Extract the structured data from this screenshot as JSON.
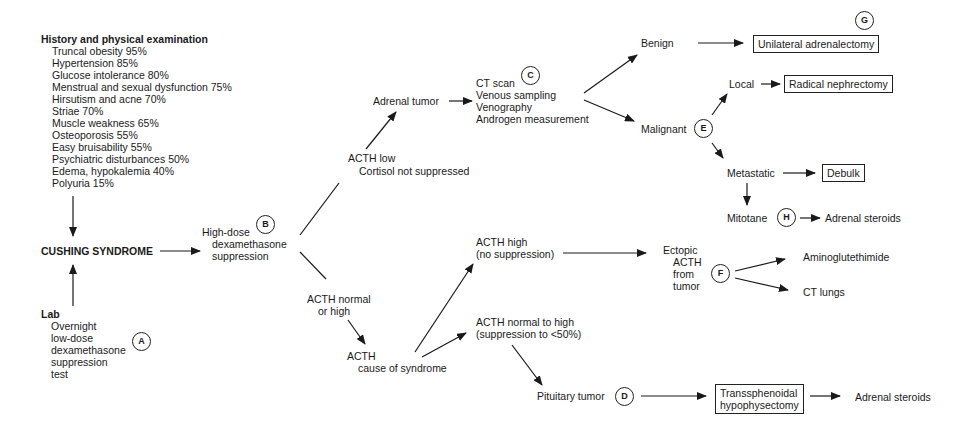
{
  "diagram": {
    "history": {
      "heading": "History and physical examination",
      "items": [
        "Truncal obesity 95%",
        "Hypertension 85%",
        "Glucose intolerance 80%",
        "Menstrual and sexual dysfunction 75%",
        "Hirsutism and acne 70%",
        "Striae 70%",
        "Muscle weakness 65%",
        "Osteoporosis 55%",
        "Easy bruisability 55%",
        "Psychiatric disturbances 50%",
        "Edema, hypokalemia 40%",
        "Polyuria 15%"
      ]
    },
    "cushing": "CUSHING SYNDROME",
    "lab": {
      "heading": "Lab",
      "lines": [
        "Overnight",
        "low-dose",
        "dexamethasone",
        "suppression",
        "test"
      ]
    },
    "high_dose": {
      "lines": [
        "High-dose",
        "dexamethasone",
        "suppression"
      ]
    },
    "acth_low": {
      "lines": [
        "ACTH low",
        "Cortisol not suppressed"
      ]
    },
    "adrenal_tumor": "Adrenal tumor",
    "ct_scan": {
      "lines": [
        "CT scan",
        "Venous sampling",
        "Venography",
        "Androgen measurement"
      ]
    },
    "benign": "Benign",
    "malignant": "Malignant",
    "local": "Local",
    "metastatic": "Metastatic",
    "mitotane": "Mitotane",
    "adrenal_steroids_1": "Adrenal steroids",
    "unilateral": "Unilateral adrenalectomy",
    "radical": "Radical nephrectomy",
    "debulk": "Debulk",
    "acth_normal_high": {
      "lines": [
        "ACTH normal",
        "or high"
      ]
    },
    "acth_cause": {
      "lines": [
        "ACTH",
        "cause of syndrome"
      ]
    },
    "acth_high": {
      "lines": [
        "ACTH high",
        "(no suppression)"
      ]
    },
    "acth_norm_to_high": {
      "lines": [
        "ACTH normal to high",
        "(suppression to <50%)"
      ]
    },
    "ectopic": {
      "lines": [
        "Ectopic",
        "ACTH",
        "from",
        "tumor"
      ]
    },
    "aminoglutethimide": "Aminoglutethimide",
    "ct_lungs": "CT lungs",
    "pituitary": "Pituitary tumor",
    "transsphenoidal": {
      "lines": [
        "Transsphenoidal",
        "hypophysectomy"
      ]
    },
    "adrenal_steroids_2": "Adrenal steroids",
    "markers": {
      "A": "A",
      "B": "B",
      "C": "C",
      "D": "D",
      "E": "E",
      "F": "F",
      "G": "G",
      "H": "H"
    }
  }
}
